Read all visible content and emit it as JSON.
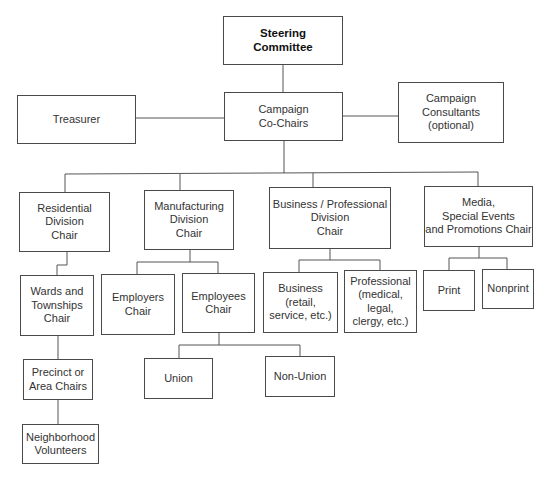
{
  "diagram": {
    "type": "organization-chart",
    "nodes": {
      "steering": {
        "label": "Steering\nCommittee"
      },
      "cochairs": {
        "label": "Campaign\nCo-Chairs"
      },
      "treasurer": {
        "label": "Treasurer"
      },
      "consultants": {
        "label": "Campaign\nConsultants\n(optional)"
      },
      "residential": {
        "label": "Residential\nDivision\nChair"
      },
      "manufacturing": {
        "label": "Manufacturing\nDivision\nChair"
      },
      "business_prof": {
        "label": "Business / Professional\nDivision\nChair"
      },
      "media": {
        "label": "Media,\nSpecial Events\nand Promotions Chair"
      },
      "wards": {
        "label": "Wards and\nTownships\nChair"
      },
      "precinct": {
        "label": "Precinct or\nArea Chairs"
      },
      "neighborhood": {
        "label": "Neighborhood\nVolunteers"
      },
      "employers": {
        "label": "Employers\nChair"
      },
      "employees": {
        "label": "Employees\nChair"
      },
      "union": {
        "label": "Union"
      },
      "nonunion": {
        "label": "Non-Union"
      },
      "business": {
        "label": "Business\n(retail,\nservice, etc.)"
      },
      "professional": {
        "label": "Professional\n(medical,\nlegal,\nclergy, etc.)"
      },
      "print": {
        "label": "Print"
      },
      "nonprint": {
        "label": "Nonprint"
      }
    },
    "edges": [
      [
        "steering",
        "cochairs"
      ],
      [
        "cochairs",
        "treasurer"
      ],
      [
        "cochairs",
        "consultants"
      ],
      [
        "cochairs",
        "residential"
      ],
      [
        "cochairs",
        "manufacturing"
      ],
      [
        "cochairs",
        "business_prof"
      ],
      [
        "cochairs",
        "media"
      ],
      [
        "residential",
        "wards"
      ],
      [
        "wards",
        "precinct"
      ],
      [
        "precinct",
        "neighborhood"
      ],
      [
        "manufacturing",
        "employers"
      ],
      [
        "manufacturing",
        "employees"
      ],
      [
        "employees",
        "union"
      ],
      [
        "employees",
        "nonunion"
      ],
      [
        "business_prof",
        "business"
      ],
      [
        "business_prof",
        "professional"
      ],
      [
        "media",
        "print"
      ],
      [
        "media",
        "nonprint"
      ]
    ]
  }
}
